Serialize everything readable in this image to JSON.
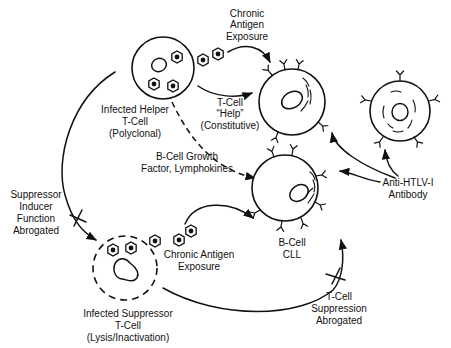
{
  "diagram": {
    "cells": {
      "helper_t": {
        "label_lines": [
          "Infected Helper",
          "T-Cell",
          "(Polyclonal)"
        ]
      },
      "suppressor_t": {
        "label_lines": [
          "Infected Suppressor",
          "T-Cell",
          "(Lysis/Inactivation)"
        ]
      },
      "b_cell_cll": {
        "label_lines": [
          "B-Cell",
          "CLL"
        ]
      },
      "b_cell_upper": {
        "label_lines": []
      },
      "b_cell_right": {
        "label_lines": []
      }
    },
    "labels": {
      "chronic_antigen_top": [
        "Chronic",
        "Antigen",
        "Exposure"
      ],
      "t_cell_help": [
        "T-Cell",
        "“Help”",
        "(Constitutive)"
      ],
      "growth_factor": [
        "B-Cell Growth",
        "Factor, Lymphokines"
      ],
      "suppressor_inducer": [
        "Suppressor",
        "Inducer",
        "Function",
        "Abrogated"
      ],
      "chronic_antigen_bottom": [
        "Chronic Antigen",
        "Exposure"
      ],
      "anti_htlv": [
        "Anti-HTLV-I",
        "Antibody"
      ],
      "t_cell_suppression": [
        "T-Cell",
        "Suppression",
        "Abrogated"
      ]
    },
    "edges": [
      {
        "from": "helper_t",
        "to": "b_cell_upper",
        "label": "T-Cell “Help” (Constitutive)",
        "style": "solid"
      },
      {
        "from": "helper_t",
        "to": "b_cell_cll",
        "label": "B-Cell Growth Factor, Lymphokines",
        "style": "dashed"
      },
      {
        "from": "helper_t",
        "to": "suppressor_t",
        "label": "Suppressor Inducer Function Abrogated",
        "style": "solid-blocked"
      },
      {
        "from": "suppressor_t",
        "to": "b_cell_cll",
        "label": "T-Cell Suppression Abrogated",
        "style": "solid-blocked"
      },
      {
        "from": "virus_particles_top",
        "to": "b_cell_upper",
        "label": "Chronic Antigen Exposure",
        "style": "solid"
      },
      {
        "from": "virus_particles_bottom",
        "to": "b_cell_cll",
        "label": "Chronic Antigen Exposure",
        "style": "solid"
      },
      {
        "from": "anti_htlv",
        "to": "b_cell_upper",
        "style": "solid"
      },
      {
        "from": "anti_htlv",
        "to": "b_cell_cll",
        "style": "solid"
      },
      {
        "from": "anti_htlv",
        "to": "b_cell_right",
        "style": "solid"
      }
    ]
  }
}
